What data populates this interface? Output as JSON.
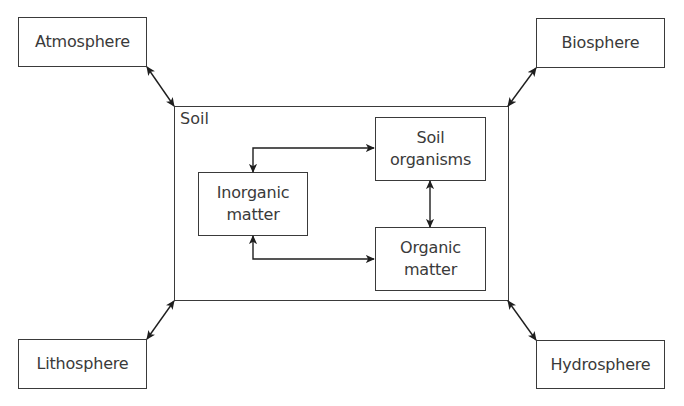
{
  "diagram": {
    "container": {
      "label": "Soil"
    },
    "outer_nodes": {
      "atmosphere": "Atmosphere",
      "biosphere": "Biosphere",
      "lithosphere": "Lithosphere",
      "hydrosphere": "Hydrosphere"
    },
    "inner_nodes": {
      "soil_organisms": "Soil\norganisms",
      "inorganic_matter": "Inorganic\nmatter",
      "organic_matter": "Organic\nmatter"
    },
    "edges": [
      {
        "from": "Atmosphere",
        "to": "Soil",
        "direction": "bidirectional"
      },
      {
        "from": "Biosphere",
        "to": "Soil",
        "direction": "bidirectional"
      },
      {
        "from": "Lithosphere",
        "to": "Soil",
        "direction": "bidirectional"
      },
      {
        "from": "Hydrosphere",
        "to": "Soil",
        "direction": "bidirectional"
      },
      {
        "from": "Inorganic matter",
        "to": "Soil organisms",
        "direction": "bidirectional"
      },
      {
        "from": "Inorganic matter",
        "to": "Organic matter",
        "direction": "bidirectional"
      },
      {
        "from": "Soil organisms",
        "to": "Organic matter",
        "direction": "bidirectional"
      }
    ],
    "colors": {
      "stroke": "#3a3a3a",
      "background": "#ffffff"
    }
  }
}
